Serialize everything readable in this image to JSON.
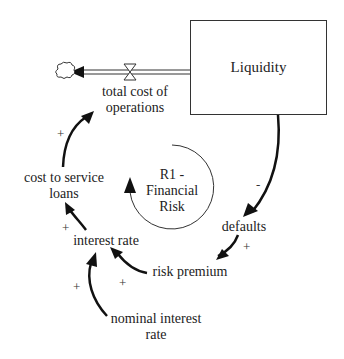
{
  "diagram": {
    "type": "causal-loop / stock-flow",
    "stock": {
      "label": "Liquidity"
    },
    "flow": {
      "label": "total cost of operations",
      "line1": "total cost of",
      "line2": "operations"
    },
    "loop": {
      "line1": "R1 -",
      "line2": "Financial",
      "line3": "Risk",
      "name": "R1 - Financial Risk",
      "type": "reinforcing"
    },
    "variables": {
      "cost_to_service_loans": {
        "line1": "cost to service",
        "line2": "loans"
      },
      "interest_rate": {
        "label": "interest rate"
      },
      "defaults": {
        "label": "defaults"
      },
      "risk_premium": {
        "label": "risk premium"
      },
      "nominal_interest_rate": {
        "line1": "nominal interest",
        "line2": "rate"
      }
    },
    "links": [
      {
        "from": "Liquidity",
        "to": "defaults",
        "polarity": "-"
      },
      {
        "from": "defaults",
        "to": "risk premium",
        "polarity": "+"
      },
      {
        "from": "risk premium",
        "to": "interest rate",
        "polarity": "+"
      },
      {
        "from": "nominal interest rate",
        "to": "interest rate",
        "polarity": "+"
      },
      {
        "from": "interest rate",
        "to": "cost to service loans",
        "polarity": "+"
      },
      {
        "from": "cost to service loans",
        "to": "total cost of operations",
        "polarity": "+"
      }
    ],
    "polarities": {
      "liq_def": "-",
      "def_rp": "+",
      "rp_ir": "+",
      "nir_ir": "+",
      "ir_csl": "+",
      "csl_tco": "+"
    }
  }
}
